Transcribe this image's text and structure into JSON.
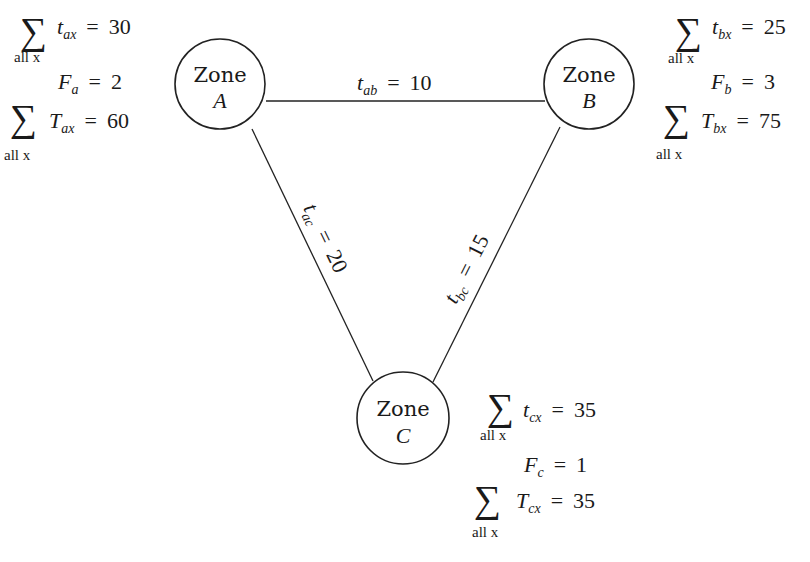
{
  "diagram": {
    "type": "zone-network",
    "colors": {
      "stroke": "#222222",
      "text": "#1a1a1a",
      "background": "#ffffff"
    },
    "zones": [
      {
        "id": "A",
        "label": "Zone",
        "letter": "A",
        "sum_t": {
          "sigma": "∑",
          "under": "all x",
          "var": "t",
          "sub": "ax",
          "eq": "=",
          "value": "30"
        },
        "f": {
          "var": "F",
          "sub": "a",
          "eq": "=",
          "value": "2"
        },
        "sum_T": {
          "sigma": "∑",
          "under": "all x",
          "var": "T",
          "sub": "ax",
          "eq": "=",
          "value": "60"
        }
      },
      {
        "id": "B",
        "label": "Zone",
        "letter": "B",
        "sum_t": {
          "sigma": "∑",
          "under": "all x",
          "var": "t",
          "sub": "bx",
          "eq": "=",
          "value": "25"
        },
        "f": {
          "var": "F",
          "sub": "b",
          "eq": "=",
          "value": "3"
        },
        "sum_T": {
          "sigma": "∑",
          "under": "all x",
          "var": "T",
          "sub": "bx",
          "eq": "=",
          "value": "75"
        }
      },
      {
        "id": "C",
        "label": "Zone",
        "letter": "C",
        "sum_t": {
          "sigma": "∑",
          "under": "all x",
          "var": "t",
          "sub": "cx",
          "eq": "=",
          "value": "35"
        },
        "f": {
          "var": "F",
          "sub": "c",
          "eq": "=",
          "value": "1"
        },
        "sum_T": {
          "sigma": "∑",
          "under": "all x",
          "var": "T",
          "sub": "cx",
          "eq": "=",
          "value": "35"
        }
      }
    ],
    "links": [
      {
        "from": "A",
        "to": "B",
        "var": "t",
        "sub": "ab",
        "eq": "=",
        "value": "10"
      },
      {
        "from": "A",
        "to": "C",
        "var": "t",
        "sub": "ac",
        "eq": "=",
        "value": "20"
      },
      {
        "from": "B",
        "to": "C",
        "var": "t",
        "sub": "bc",
        "eq": "=",
        "value": "15"
      }
    ]
  }
}
